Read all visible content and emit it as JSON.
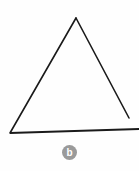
{
  "figure": {
    "background_color": "#fefefe",
    "stroke_color": "#1a1a1a",
    "panel_label": {
      "letter": "b",
      "badge_color": "#9a9a9a",
      "text_color": "#ffffff",
      "center_x": 69.5,
      "center_y": 152.5,
      "radius": 7.5
    },
    "shape": {
      "name": "triangle",
      "type": "open-outline",
      "stroke_width": 1.6,
      "vertices": {
        "apex": {
          "x": 76,
          "y": 18
        },
        "bottom_left": {
          "x": 10,
          "y": 133
        },
        "bottom_right": {
          "x": 129,
          "y": 118
        }
      },
      "segments": [
        {
          "name": "left-leg",
          "x1": 76,
          "y1": 18,
          "x2": 10,
          "y2": 133
        },
        {
          "name": "right-leg",
          "x1": 76,
          "y1": 18,
          "x2": 129,
          "y2": 118
        },
        {
          "name": "base-line",
          "x1": 10,
          "y1": 133,
          "x2": 139,
          "y2": 129
        }
      ],
      "notes": "right leg terminates short of the base; base line runs past the right vertex to the image edge"
    }
  }
}
